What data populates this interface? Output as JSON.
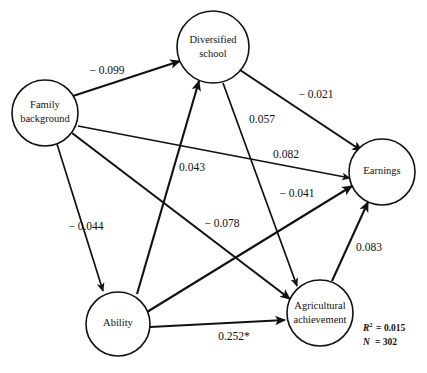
{
  "figure": {
    "type": "path-diagram",
    "title": "",
    "background_color": "#ffffff",
    "line_color": "#111111",
    "width": 427,
    "height": 373
  },
  "nodes": [
    {
      "id": "family-background",
      "label_line1": "Family",
      "label_line2": "background",
      "cx": 45,
      "cy": 113,
      "r": 33
    },
    {
      "id": "diversified-school",
      "label_line1": "Diversified",
      "label_line2": "school",
      "cx": 213,
      "cy": 47,
      "r": 36
    },
    {
      "id": "earnings",
      "label_line1": "Earnings",
      "label_line2": "",
      "cx": 382,
      "cy": 172,
      "r": 33
    },
    {
      "id": "ability",
      "label_line1": "Ability",
      "label_line2": "",
      "cx": 118,
      "cy": 324,
      "r": 32
    },
    {
      "id": "agricultural-achievement",
      "label_line1": "Agricultural",
      "label_line2": "achievement",
      "cx": 320,
      "cy": 313,
      "r": 33
    }
  ],
  "edges": [
    {
      "id": "family-to-diversified",
      "from": "family-background",
      "to": "diversified-school",
      "coefficient": "− 0.099",
      "label_x": 107,
      "label_y": 71
    },
    {
      "id": "diversified-to-earnings",
      "from": "diversified-school",
      "to": "earnings",
      "coefficient": "− 0.021",
      "label_x": 316,
      "label_y": 95
    },
    {
      "id": "diversified-to-agricultural",
      "from": "diversified-school",
      "to": "agricultural-achievement",
      "coefficient": "0.057",
      "label_x": 262,
      "label_y": 120
    },
    {
      "id": "ability-to-diversified",
      "from": "ability",
      "to": "diversified-school",
      "coefficient": "0.043",
      "label_x": 192,
      "label_y": 168
    },
    {
      "id": "family-to-earnings",
      "from": "family-background",
      "to": "earnings",
      "coefficient": "0.082",
      "label_x": 286,
      "label_y": 155
    },
    {
      "id": "family-to-ability",
      "from": "family-background",
      "to": "ability",
      "coefficient": "− 0.044",
      "label_x": 86,
      "label_y": 227
    },
    {
      "id": "family-to-agricultural",
      "from": "family-background",
      "to": "agricultural-achievement",
      "coefficient": "− 0.078",
      "label_x": 222,
      "label_y": 224
    },
    {
      "id": "ability-to-earnings",
      "from": "ability",
      "to": "earnings",
      "coefficient": "− 0.041",
      "label_x": 297,
      "label_y": 194
    },
    {
      "id": "agricultural-to-earnings",
      "from": "agricultural-achievement",
      "to": "earnings",
      "coefficient": "0.083",
      "label_x": 369,
      "label_y": 248
    },
    {
      "id": "ability-to-agricultural",
      "from": "ability",
      "to": "agricultural-achievement",
      "coefficient": "0.252*",
      "label_x": 234,
      "label_y": 337
    }
  ],
  "statistics": {
    "r_squared_symbol": "R",
    "r_squared_exponent": "2",
    "r_squared_value": "= 0.015",
    "n_label": "N",
    "n_value": "= 302"
  }
}
